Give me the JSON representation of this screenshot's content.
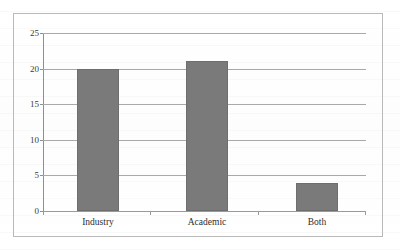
{
  "figure": {
    "background_color": "#ffffff",
    "frame_color": "#b9b9b9",
    "bar_color": "#7a7a7a",
    "grid_color": "#a9a9a9",
    "axis_color": "#8f8f8f"
  },
  "chart_data": {
    "type": "bar",
    "title": "",
    "subtitle": "",
    "xlabel": "",
    "ylabel": "",
    "categories": [
      "Industry",
      "Academic",
      "Both"
    ],
    "values": [
      19.9,
      21,
      4
    ],
    "series": [
      {
        "name": "",
        "values": [
          19.9,
          21,
          4
        ]
      }
    ],
    "ylim": [
      0,
      25
    ],
    "yticks": [
      0,
      5,
      10,
      15,
      20,
      25
    ],
    "ytick_labels": [
      "0",
      "5",
      "10",
      "15",
      "20",
      "25"
    ],
    "xtick_labels": [
      "Industry",
      "Academic",
      "Both"
    ],
    "grid": true,
    "grid_axis": "y",
    "legend": false,
    "legend_position": "none",
    "annotations": []
  }
}
